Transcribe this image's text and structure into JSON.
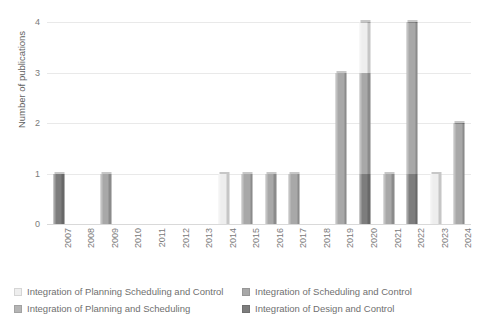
{
  "chart_data": {
    "type": "bar",
    "stacked": true,
    "title": "",
    "xlabel": "",
    "ylabel": "Number of publications",
    "ylim": [
      0,
      4
    ],
    "yticks": [
      0,
      1,
      2,
      3,
      4
    ],
    "ytick_labels": [
      "0",
      "1",
      "2",
      "3",
      "4"
    ],
    "grid": true,
    "grid_axis": "y",
    "legend_position": "bottom",
    "categories": [
      "2007",
      "2008",
      "2009",
      "2010",
      "2011",
      "2012",
      "2013",
      "2014",
      "2015",
      "2016",
      "2017",
      "2018",
      "2019",
      "2020",
      "2021",
      "2022",
      "2023",
      "2024"
    ],
    "series": [
      {
        "name": "Integration of Planning Scheduling and Control",
        "color": "#eeeeee",
        "values": [
          0,
          0,
          0,
          0,
          0,
          0,
          0,
          1,
          0,
          0,
          0,
          0,
          0,
          1,
          0,
          0,
          1,
          0
        ]
      },
      {
        "name": "Integration of Planning and Scheduling",
        "color": "#b5b5b5",
        "values": [
          0,
          0,
          0,
          0,
          0,
          0,
          0,
          0,
          0,
          0,
          0,
          0,
          0,
          0,
          0,
          0,
          0,
          0
        ]
      },
      {
        "name": "Integration of Scheduling and Control",
        "color": "#a8a8a8",
        "values": [
          0,
          0,
          1,
          0,
          0,
          0,
          0,
          0,
          1,
          1,
          1,
          0,
          3,
          2,
          1,
          3,
          0,
          2
        ]
      },
      {
        "name": "Integration of Design and Control",
        "color": "#7d7d7d",
        "values": [
          1,
          0,
          0,
          0,
          0,
          0,
          0,
          0,
          0,
          0,
          0,
          0,
          0,
          1,
          0,
          1,
          0,
          0
        ]
      }
    ],
    "totals": [
      1,
      0,
      1,
      0,
      0,
      0,
      0,
      1,
      1,
      1,
      1,
      0,
      3,
      4,
      1,
      4,
      1,
      2
    ]
  },
  "legend": {
    "items": [
      {
        "label": "Integration of Planning Scheduling and Control",
        "color": "#eeeeee"
      },
      {
        "label": "Integration of Scheduling and Control",
        "color": "#a8a8a8"
      },
      {
        "label": "Integration of Planning and Scheduling",
        "color": "#b5b5b5"
      },
      {
        "label": "Integration of Design and Control",
        "color": "#7d7d7d"
      }
    ]
  },
  "axes": {
    "y_title": "Number of publications"
  },
  "colors": {
    "grid": "#e9e9e9",
    "text": "#7a7a7a",
    "background": "#ffffff"
  }
}
